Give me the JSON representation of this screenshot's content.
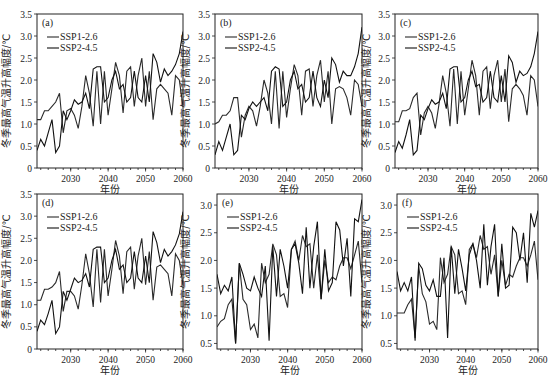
{
  "figure": {
    "xlabel": "年份",
    "ylabel": "冬季最高气温升高幅度/℃",
    "legend": [
      "SSP1-2.6",
      "SSP2-4.5"
    ]
  },
  "chart_data": [
    {
      "type": "line",
      "panel": "(a)",
      "xlabel": "年份",
      "ylabel": "冬季最高气温升高幅度/℃",
      "xlim": [
        2021,
        2060
      ],
      "ylim": [
        0,
        3.5
      ],
      "xticks": [
        2030,
        2040,
        2050,
        2060
      ],
      "yticks": [
        0,
        0.5,
        1.0,
        1.5,
        2.0,
        2.5,
        3.0,
        3.5
      ],
      "legend_position": "upper left",
      "grid": false,
      "x": [
        2021,
        2022,
        2023,
        2024,
        2025,
        2026,
        2027,
        2028,
        2029,
        2030,
        2031,
        2032,
        2033,
        2034,
        2035,
        2036,
        2037,
        2038,
        2039,
        2040,
        2041,
        2042,
        2043,
        2044,
        2045,
        2046,
        2047,
        2048,
        2049,
        2050,
        2051,
        2052,
        2053,
        2054,
        2055,
        2056,
        2057,
        2058,
        2059,
        2060
      ],
      "series": [
        {
          "name": "SSP1-2.6",
          "values": [
            1.1,
            1.1,
            1.3,
            1.3,
            1.4,
            1.5,
            1.7,
            0.8,
            1.3,
            1.35,
            1.2,
            0.9,
            1.4,
            2.1,
            1.7,
            0.95,
            2.2,
            1.0,
            2.2,
            1.2,
            1.8,
            2.4,
            2.1,
            1.25,
            2.2,
            2.3,
            1.4,
            2.1,
            2.5,
            1.4,
            2.2,
            1.1,
            1.8,
            1.9,
            1.8,
            1.7,
            1.2,
            2.1,
            2.0,
            1.4
          ]
        },
        {
          "name": "SSP2-4.5",
          "values": [
            0.4,
            0.65,
            0.5,
            0.8,
            1.1,
            0.35,
            0.5,
            1.3,
            1.1,
            1.3,
            1.55,
            1.45,
            1.5,
            1.7,
            1.35,
            2.25,
            2.3,
            2.3,
            1.5,
            1.6,
            2.0,
            2.2,
            1.8,
            1.9,
            1.5,
            1.6,
            2.2,
            1.6,
            1.5,
            2.1,
            1.5,
            2.6,
            2.4,
            1.95,
            2.25,
            2.1,
            2.2,
            2.35,
            2.6,
            3.1
          ]
        }
      ]
    },
    {
      "type": "line",
      "panel": "(b)",
      "xlabel": "年份",
      "ylabel": "冬季最高气温升高幅度/℃",
      "xlim": [
        2021,
        2060
      ],
      "ylim": [
        0,
        3.5
      ],
      "xticks": [
        2030,
        2040,
        2050,
        2060
      ],
      "yticks": [
        0,
        0.5,
        1.0,
        1.5,
        2.0,
        2.5,
        3.0,
        3.5
      ],
      "legend_position": "upper left",
      "grid": false,
      "x": [
        2021,
        2022,
        2023,
        2024,
        2025,
        2026,
        2027,
        2028,
        2029,
        2030,
        2031,
        2032,
        2033,
        2034,
        2035,
        2036,
        2037,
        2038,
        2039,
        2040,
        2041,
        2042,
        2043,
        2044,
        2045,
        2046,
        2047,
        2048,
        2049,
        2050,
        2051,
        2052,
        2053,
        2054,
        2055,
        2056,
        2057,
        2058,
        2059,
        2060
      ],
      "series": [
        {
          "name": "SSP1-2.6",
          "values": [
            1.0,
            1.05,
            1.2,
            1.2,
            1.3,
            1.6,
            1.6,
            0.7,
            1.2,
            1.4,
            1.3,
            0.95,
            1.4,
            2.0,
            1.7,
            1.0,
            2.2,
            0.9,
            2.2,
            1.15,
            1.8,
            2.35,
            2.1,
            1.2,
            2.2,
            2.25,
            1.4,
            2.1,
            2.45,
            1.5,
            2.2,
            1.0,
            1.8,
            1.85,
            1.8,
            1.6,
            1.2,
            2.0,
            1.9,
            1.4
          ]
        },
        {
          "name": "SSP2-4.5",
          "values": [
            0.3,
            0.6,
            0.4,
            0.7,
            1.0,
            0.3,
            0.4,
            1.2,
            1.1,
            1.35,
            1.5,
            1.4,
            1.5,
            1.6,
            1.3,
            2.2,
            2.3,
            2.25,
            1.4,
            1.5,
            2.0,
            2.2,
            1.8,
            1.9,
            1.5,
            1.6,
            2.2,
            1.6,
            1.4,
            2.0,
            1.6,
            2.5,
            2.35,
            1.95,
            2.2,
            2.1,
            2.1,
            2.3,
            2.6,
            3.2
          ]
        }
      ]
    },
    {
      "type": "line",
      "panel": "(c)",
      "xlabel": "年份",
      "ylabel": "冬季最高气温升高幅度/℃",
      "xlim": [
        2021,
        2060
      ],
      "ylim": [
        0,
        3.5
      ],
      "xticks": [
        2030,
        2040,
        2050,
        2060
      ],
      "yticks": [
        0,
        0.5,
        1.0,
        1.5,
        2.0,
        2.5,
        3.0,
        3.5
      ],
      "legend_position": "upper left",
      "grid": false,
      "x": [
        2021,
        2022,
        2023,
        2024,
        2025,
        2026,
        2027,
        2028,
        2029,
        2030,
        2031,
        2032,
        2033,
        2034,
        2035,
        2036,
        2037,
        2038,
        2039,
        2040,
        2041,
        2042,
        2043,
        2044,
        2045,
        2046,
        2047,
        2048,
        2049,
        2050,
        2051,
        2052,
        2053,
        2054,
        2055,
        2056,
        2057,
        2058,
        2059,
        2060
      ],
      "series": [
        {
          "name": "SSP1-2.6",
          "values": [
            1.05,
            1.05,
            1.3,
            1.3,
            1.35,
            1.6,
            1.7,
            0.75,
            1.25,
            1.4,
            1.25,
            0.9,
            1.45,
            2.1,
            1.7,
            0.95,
            2.25,
            1.0,
            2.2,
            1.2,
            1.8,
            2.45,
            2.1,
            1.2,
            2.2,
            2.3,
            1.35,
            2.1,
            2.45,
            1.5,
            2.25,
            1.05,
            1.8,
            1.9,
            1.8,
            1.65,
            1.2,
            2.1,
            2.0,
            1.4
          ]
        },
        {
          "name": "SSP2-4.5",
          "values": [
            0.35,
            0.6,
            0.45,
            0.75,
            1.1,
            0.3,
            0.4,
            1.2,
            1.1,
            1.35,
            1.55,
            1.45,
            1.5,
            1.7,
            1.35,
            2.25,
            2.3,
            2.3,
            1.5,
            1.6,
            2.0,
            2.2,
            1.85,
            1.9,
            1.5,
            1.6,
            2.2,
            1.6,
            1.5,
            2.1,
            1.5,
            2.55,
            2.4,
            1.95,
            2.2,
            2.1,
            2.15,
            2.3,
            2.6,
            3.1
          ]
        }
      ]
    },
    {
      "type": "line",
      "panel": "(d)",
      "xlabel": "年份",
      "ylabel": "冬季最高气温升高幅度/℃",
      "xlim": [
        2021,
        2060
      ],
      "ylim": [
        0,
        3.5
      ],
      "xticks": [
        2030,
        2040,
        2050,
        2060
      ],
      "yticks": [
        0,
        0.5,
        1.0,
        1.5,
        2.0,
        2.5,
        3.0,
        3.5
      ],
      "legend_position": "upper left",
      "grid": false,
      "x": [
        2021,
        2022,
        2023,
        2024,
        2025,
        2026,
        2027,
        2028,
        2029,
        2030,
        2031,
        2032,
        2033,
        2034,
        2035,
        2036,
        2037,
        2038,
        2039,
        2040,
        2041,
        2042,
        2043,
        2044,
        2045,
        2046,
        2047,
        2048,
        2049,
        2050,
        2051,
        2052,
        2053,
        2054,
        2055,
        2056,
        2057,
        2058,
        2059,
        2060
      ],
      "series": [
        {
          "name": "SSP1-2.6",
          "values": [
            1.1,
            1.1,
            1.35,
            1.35,
            1.4,
            1.5,
            1.75,
            0.85,
            1.3,
            1.3,
            1.2,
            0.9,
            1.45,
            2.15,
            1.7,
            0.95,
            2.25,
            1.05,
            2.25,
            1.2,
            1.8,
            2.45,
            2.1,
            1.25,
            2.2,
            2.3,
            1.35,
            2.1,
            2.5,
            1.45,
            2.2,
            1.1,
            1.85,
            1.9,
            1.8,
            1.7,
            1.2,
            2.15,
            2.0,
            1.45
          ]
        },
        {
          "name": "SSP2-4.5",
          "values": [
            0.4,
            0.65,
            0.55,
            0.8,
            1.1,
            0.35,
            0.5,
            1.3,
            1.1,
            1.35,
            1.6,
            1.5,
            1.55,
            1.7,
            1.4,
            2.25,
            2.3,
            2.3,
            1.5,
            1.6,
            2.0,
            2.25,
            1.8,
            1.9,
            1.5,
            1.6,
            2.2,
            1.6,
            1.5,
            2.1,
            1.5,
            2.65,
            2.4,
            1.95,
            2.25,
            2.1,
            2.2,
            2.35,
            2.6,
            3.1
          ]
        }
      ]
    },
    {
      "type": "line",
      "panel": "(e)",
      "xlabel": "年份",
      "ylabel": "冬季最高气温升高幅度/℃",
      "xlim": [
        2021,
        2060
      ],
      "ylim": [
        0.4,
        3.2
      ],
      "xticks": [
        2030,
        2040,
        2050,
        2060
      ],
      "yticks": [
        0.5,
        1.0,
        1.5,
        2.0,
        2.5,
        3.0
      ],
      "legend_position": "upper left",
      "grid": false,
      "x": [
        2021,
        2022,
        2023,
        2024,
        2025,
        2026,
        2027,
        2028,
        2029,
        2030,
        2031,
        2032,
        2033,
        2034,
        2035,
        2036,
        2037,
        2038,
        2039,
        2040,
        2041,
        2042,
        2043,
        2044,
        2045,
        2046,
        2047,
        2048,
        2049,
        2050,
        2051,
        2052,
        2053,
        2054,
        2055,
        2056,
        2057,
        2058,
        2059,
        2060
      ],
      "series": [
        {
          "name": "SSP1-2.6",
          "values": [
            0.8,
            0.9,
            0.95,
            1.2,
            1.3,
            0.5,
            1.95,
            1.3,
            1.2,
            0.75,
            0.85,
            0.6,
            1.95,
            1.6,
            1.75,
            2.3,
            2.1,
            1.35,
            1.4,
            1.15,
            2.2,
            2.35,
            2.0,
            2.45,
            2.25,
            2.3,
            1.5,
            2.1,
            1.3,
            2.0,
            1.6,
            1.7,
            1.65,
            1.9,
            2.05,
            2.05,
            1.85,
            2.1,
            2.35,
            1.6
          ]
        },
        {
          "name": "SSP2-4.5",
          "values": [
            1.75,
            1.4,
            1.55,
            1.45,
            1.7,
            0.5,
            1.95,
            1.75,
            1.5,
            1.45,
            1.7,
            1.5,
            1.35,
            1.9,
            0.55,
            2.25,
            1.35,
            2.2,
            1.9,
            1.5,
            2.2,
            2.3,
            1.95,
            1.4,
            2.6,
            1.5,
            2.25,
            2.7,
            1.3,
            2.2,
            1.45,
            1.6,
            2.7,
            2.55,
            1.9,
            2.4,
            1.35,
            2.75,
            2.7,
            3.1
          ]
        }
      ]
    },
    {
      "type": "line",
      "panel": "(f)",
      "xlabel": "年份",
      "ylabel": "冬季最高气温升高幅度/℃",
      "xlim": [
        2021,
        2060
      ],
      "ylim": [
        0.4,
        3.2
      ],
      "xticks": [
        2030,
        2040,
        2050,
        2060
      ],
      "yticks": [
        0.5,
        1.0,
        1.5,
        2.0,
        2.5,
        3.0
      ],
      "legend_position": "upper left",
      "grid": false,
      "x": [
        2021,
        2022,
        2023,
        2024,
        2025,
        2026,
        2027,
        2028,
        2029,
        2030,
        2031,
        2032,
        2033,
        2034,
        2035,
        2036,
        2037,
        2038,
        2039,
        2040,
        2041,
        2042,
        2043,
        2044,
        2045,
        2046,
        2047,
        2048,
        2049,
        2050,
        2051,
        2052,
        2053,
        2054,
        2055,
        2056,
        2057,
        2058,
        2059,
        2060
      ],
      "series": [
        {
          "name": "SSP1-2.6",
          "values": [
            1.05,
            1.05,
            1.05,
            1.2,
            1.3,
            0.6,
            1.9,
            1.4,
            1.25,
            0.85,
            0.9,
            0.75,
            2.05,
            1.6,
            1.75,
            2.25,
            2.1,
            1.4,
            1.45,
            1.2,
            2.2,
            2.3,
            2.05,
            2.45,
            2.2,
            2.25,
            1.75,
            2.1,
            1.35,
            2.0,
            1.55,
            1.75,
            1.7,
            1.9,
            2.05,
            2.05,
            1.9,
            2.1,
            2.35,
            1.65
          ]
        },
        {
          "name": "SSP2-4.5",
          "values": [
            1.8,
            1.45,
            1.6,
            1.45,
            1.7,
            0.55,
            1.95,
            1.85,
            1.55,
            1.45,
            1.65,
            1.35,
            1.35,
            2.05,
            0.6,
            2.25,
            1.4,
            2.2,
            1.85,
            1.45,
            2.1,
            2.3,
            2.0,
            1.5,
            2.65,
            1.55,
            2.25,
            2.65,
            1.35,
            2.3,
            1.5,
            1.55,
            2.6,
            2.5,
            2.0,
            2.5,
            1.6,
            2.85,
            2.6,
            2.9
          ]
        }
      ]
    }
  ]
}
